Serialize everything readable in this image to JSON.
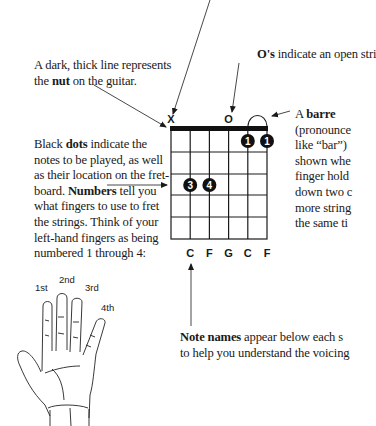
{
  "annotations": {
    "nut": {
      "pre": "A dark, thick line represents",
      "line2_pre": "the ",
      "bold": "nut",
      "line2_post": " on the guitar."
    },
    "open": {
      "bold": "O's",
      "post": " indicate an open stri"
    },
    "barre": {
      "pre": "A ",
      "bold": "barre",
      "lines": [
        "(pronounce",
        "like “bar”)",
        "shown whe",
        "finger hold",
        "down two c",
        "more string",
        "the same ti"
      ]
    },
    "dots": {
      "line1_pre": "Black ",
      "line1_bold": "dots",
      "line1_post": " indicate the",
      "line2": "notes to be played, as well",
      "line3": "as their location on the fret-",
      "line4_pre": "board. ",
      "line4_bold": "Numbers",
      "line4_post": " tell you",
      "line5": "what fingers to use to fret",
      "line6": "the strings. Think of your",
      "line7": "left-hand fingers as being",
      "line8": "numbered 1 through 4:"
    },
    "notes": {
      "bold": "Note names",
      "line1_post": " appear below each s",
      "line2": "to help you understand the voicing"
    }
  },
  "chord_diagram": {
    "string_markers": [
      "X",
      "",
      "",
      "O",
      "",
      ""
    ],
    "frets_shown": 5,
    "strings": 6,
    "finger_dots": [
      {
        "string": 5,
        "fret": 1,
        "finger": "1"
      },
      {
        "string": 6,
        "fret": 1,
        "finger": "1"
      },
      {
        "string": 2,
        "fret": 3,
        "finger": "3"
      },
      {
        "string": 3,
        "fret": 3,
        "finger": "4"
      }
    ],
    "barre": {
      "from_string": 5,
      "to_string": 6
    },
    "note_names": [
      "",
      "C",
      "F",
      "G",
      "C",
      "F"
    ]
  },
  "hand": {
    "finger_labels": [
      "1st",
      "2nd",
      "3rd",
      "4th"
    ]
  }
}
